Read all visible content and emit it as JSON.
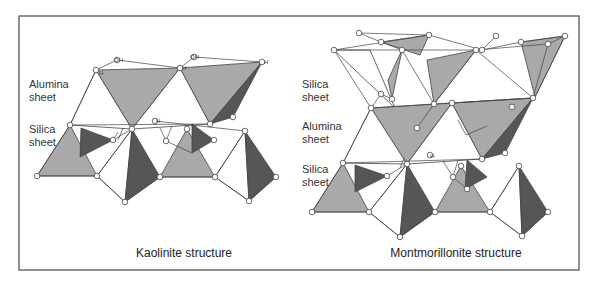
{
  "figure": {
    "frame": {
      "x": 19,
      "y": 16,
      "w": 560,
      "h": 254
    },
    "colors": {
      "light_gray": "#a9a9a9",
      "dark_gray": "#565656",
      "line": "#444444",
      "background": "#ffffff"
    },
    "panels": [
      {
        "id": "kaolinite",
        "caption": "Kaolinite structure",
        "caption_pos": [
          184,
          257
        ],
        "labels": [
          {
            "text": "Alumina",
            "x": 29,
            "y": 88
          },
          {
            "text": "sheet",
            "x": 29,
            "y": 101
          },
          {
            "text": "Silica",
            "x": 29,
            "y": 133
          },
          {
            "text": "sheet",
            "x": 29,
            "y": 146
          }
        ],
        "oh_labels": [
          {
            "text": "OH",
            "x": 114,
            "y": 62
          },
          {
            "text": "H",
            "x": 99,
            "y": 75
          },
          {
            "text": "OH",
            "x": 190,
            "y": 59
          },
          {
            "text": "H",
            "x": 182,
            "y": 70
          },
          {
            "text": "H",
            "x": 264,
            "y": 64
          },
          {
            "text": "H",
            "x": 156,
            "y": 123
          }
        ]
      },
      {
        "id": "montmorillonite",
        "caption": "Montmorillonite structure",
        "caption_pos": [
          456,
          257
        ],
        "labels": [
          {
            "text": "Silica",
            "x": 302,
            "y": 88
          },
          {
            "text": "sheet",
            "x": 302,
            "y": 101
          },
          {
            "text": "Alumina",
            "x": 302,
            "y": 130
          },
          {
            "text": "sheet",
            "x": 302,
            "y": 143
          },
          {
            "text": "Silica",
            "x": 302,
            "y": 173
          },
          {
            "text": "sheet",
            "x": 302,
            "y": 186
          }
        ],
        "oh_labels": [
          {
            "text": "H",
            "x": 430,
            "y": 158
          }
        ]
      }
    ],
    "polygons": [
      {
        "c": "white",
        "p": "96,70 70,125 132,129"
      },
      {
        "c": "light",
        "p": "96,70 180,68 132,129"
      },
      {
        "c": "dark",
        "p": "180,68 132,129 150,116"
      },
      {
        "c": "white",
        "p": "180,68 132,129 210,124"
      },
      {
        "c": "light",
        "p": "180,68 262,62 210,124"
      },
      {
        "c": "dark",
        "p": "262,62 210,124 233,117"
      },
      {
        "c": "light",
        "p": "70,125 37,176 97,176"
      },
      {
        "c": "dark",
        "p": "81,128 80,157 113,140"
      },
      {
        "c": "white",
        "p": "132,129 97,176 125,202"
      },
      {
        "c": "dark",
        "p": "132,129 125,202 160,177"
      },
      {
        "c": "light",
        "p": "187,129 160,177 215,177"
      },
      {
        "c": "dark",
        "p": "192,124 192,153 214,140"
      },
      {
        "c": "white",
        "p": "245,131 215,177 249,201"
      },
      {
        "c": "dark",
        "p": "245,131 249,201 276,177"
      },
      {
        "c": "white",
        "p": "334,50 370,50 395,108 "
      },
      {
        "c": "light",
        "p": "381,42 429,35 420,55"
      },
      {
        "c": "light",
        "p": "402,50 392,99 388,80"
      },
      {
        "c": "light",
        "p": "427,60 476,50 434,104"
      },
      {
        "c": "light",
        "p": "521,42 565,36 535,97"
      },
      {
        "c": "light",
        "p": "371,108 452,103 407,164"
      },
      {
        "c": "dark",
        "p": "452,103 407,164 430,155"
      },
      {
        "c": "white",
        "p": "452,103 407,164 482,159"
      },
      {
        "c": "light",
        "p": "452,103 533,98 482,159"
      },
      {
        "c": "dark",
        "p": "533,98 482,159 505,153"
      },
      {
        "c": "white",
        "p": "371,108 343,163 407,164"
      },
      {
        "c": "light",
        "p": "343,163 312,212 369,212"
      },
      {
        "c": "dark",
        "p": "355,165 355,192 387,176"
      },
      {
        "c": "white",
        "p": "407,164 369,212 400,237"
      },
      {
        "c": "dark",
        "p": "407,164 400,237 435,212"
      },
      {
        "c": "light",
        "p": "461,166 435,212 490,212"
      },
      {
        "c": "dark",
        "p": "467,160 465,189 487,177"
      },
      {
        "c": "white",
        "p": "519,166 490,212 522,236"
      },
      {
        "c": "dark",
        "p": "519,166 522,236 548,212"
      }
    ],
    "lines": [
      "117,60 96,70",
      "117,60 180,68",
      "194,57 180,68",
      "194,57 262,62",
      "96,70 70,125",
      "70,125 210,124",
      "155,121 245,131",
      "70,125 37,176",
      "37,176 97,176",
      "97,176 132,129",
      "97,176 125,202",
      "125,202 160,177",
      "160,177 215,177",
      "215,177 249,201",
      "249,201 276,177",
      "215,177 245,131",
      "113,140 132,129",
      "113,140 118,132",
      "166,141 172,126",
      "166,141 160,128",
      "166,141 192,153",
      "123,128 118,140",
      "334,50 371,108",
      "334,50 429,35",
      "429,35 482,50",
      "334,50 402,50",
      "402,50 476,50",
      "476,50 548,44",
      "548,44 565,36",
      "359,33 381,42",
      "359,33 429,35",
      "381,42 402,50",
      "482,50 521,42",
      "521,42 565,36",
      "482,50 496,36",
      "402,50 434,104",
      "476,50 434,104",
      "476,50 533,98",
      "548,44 533,98",
      "565,36 535,97",
      "381,94 371,108",
      "381,94 392,99",
      "371,108 533,98",
      "452,103 533,98",
      "371,108 343,163",
      "343,163 482,159",
      "343,163 312,212",
      "312,212 369,212",
      "369,212 407,164",
      "369,212 400,237",
      "400,237 435,212",
      "435,212 490,212",
      "490,212 522,236",
      "522,236 548,212",
      "490,212 519,166",
      "387,176 407,164",
      "400,168 404,158",
      "453,177 458,160",
      "453,177 443,161",
      "453,177 467,189",
      "458,120 466,135",
      "466,135 487,126",
      "417,128 434,104"
    ],
    "atoms": [
      [
        117,
        60
      ],
      [
        96,
        70
      ],
      [
        194,
        57
      ],
      [
        180,
        68
      ],
      [
        262,
        62
      ],
      [
        132,
        129
      ],
      [
        155,
        121
      ],
      [
        210,
        124
      ],
      [
        233,
        117
      ],
      [
        70,
        125
      ],
      [
        37,
        176
      ],
      [
        97,
        176
      ],
      [
        125,
        202
      ],
      [
        113,
        140
      ],
      [
        166,
        141
      ],
      [
        160,
        177
      ],
      [
        187,
        129
      ],
      [
        215,
        177
      ],
      [
        249,
        201
      ],
      [
        276,
        177
      ],
      [
        245,
        131
      ],
      [
        214,
        140
      ],
      [
        359,
        33
      ],
      [
        334,
        50
      ],
      [
        381,
        42
      ],
      [
        429,
        35
      ],
      [
        402,
        50
      ],
      [
        476,
        50
      ],
      [
        482,
        50
      ],
      [
        521,
        42
      ],
      [
        565,
        36
      ],
      [
        548,
        44
      ],
      [
        496,
        36
      ],
      [
        381,
        94
      ],
      [
        392,
        99
      ],
      [
        434,
        104
      ],
      [
        371,
        108
      ],
      [
        452,
        103
      ],
      [
        533,
        98
      ],
      [
        512,
        107
      ],
      [
        407,
        164
      ],
      [
        430,
        155
      ],
      [
        482,
        159
      ],
      [
        505,
        153
      ],
      [
        343,
        163
      ],
      [
        312,
        212
      ],
      [
        369,
        212
      ],
      [
        400,
        237
      ],
      [
        387,
        176
      ],
      [
        435,
        212
      ],
      [
        453,
        177
      ],
      [
        461,
        166
      ],
      [
        490,
        212
      ],
      [
        467,
        189
      ],
      [
        519,
        166
      ],
      [
        522,
        236
      ],
      [
        548,
        212
      ],
      [
        417,
        128
      ]
    ]
  }
}
